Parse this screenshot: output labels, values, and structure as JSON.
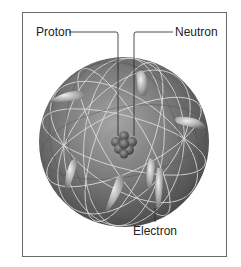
{
  "diagram": {
    "type": "atom-model",
    "labels": {
      "proton": "Proton",
      "neutron": "Neutron",
      "electron": "Electron"
    },
    "colors": {
      "sphere": "#6e6e6e",
      "sphere_highlight": "#9a9a9a",
      "orbit_lines": "#d8d8d8",
      "electron": "#bdbdbd",
      "nucleus": "#555555",
      "frame": "#6a6a6a",
      "leader_lines": "#222222"
    },
    "electron_count": 8
  }
}
